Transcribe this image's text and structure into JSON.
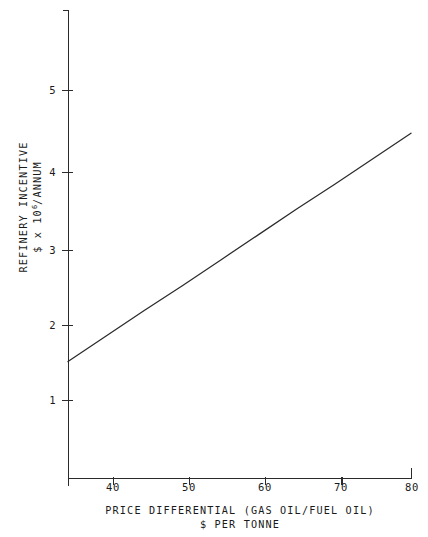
{
  "chart_data": {
    "type": "line",
    "title": "",
    "subtitle": "",
    "xlabel_line1": "PRICE DIFFERENTIAL (GAS OIL/FUEL OIL)",
    "xlabel_line2": "$ PER TONNE",
    "ylabel_line1": "REFINERY INCENTIVE",
    "ylabel_line2_prefix": "$ x 10",
    "ylabel_line2_exponent": "6",
    "ylabel_line2_suffix": "/ANNUM",
    "xlim": [
      35,
      80
    ],
    "ylim": [
      0,
      5.8
    ],
    "grid": false,
    "legend": null,
    "x_ticks": [
      40,
      50,
      60,
      70,
      80
    ],
    "x_tick_labels": [
      "40",
      "50",
      "60",
      "70",
      "80"
    ],
    "y_ticks": [
      1,
      2,
      3,
      4,
      5
    ],
    "y_tick_labels": [
      "1",
      "2",
      "3",
      "4",
      "5"
    ],
    "series": [
      {
        "name": "Refinery incentive",
        "color": "#2b2b2b",
        "x": [
          35,
          40,
          45,
          50,
          55,
          60,
          65,
          70,
          75,
          80
        ],
        "values": [
          1.5,
          1.83,
          2.16,
          2.48,
          2.81,
          3.14,
          3.47,
          3.79,
          4.12,
          4.45
        ]
      }
    ],
    "annotations": []
  },
  "axes": {
    "y_axis_name": "refinery-incentive-axis",
    "x_axis_name": "price-differential-axis"
  }
}
